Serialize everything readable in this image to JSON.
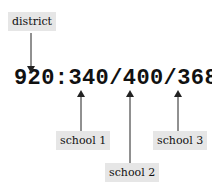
{
  "code": "920:340/400/368",
  "labels": {
    "district": "district",
    "school1": "school 1",
    "school2": "school 2",
    "school3": "school 3"
  },
  "colors": {
    "label_bg": "#e6e6e6",
    "text": "#111111",
    "arrow": "#222222"
  }
}
